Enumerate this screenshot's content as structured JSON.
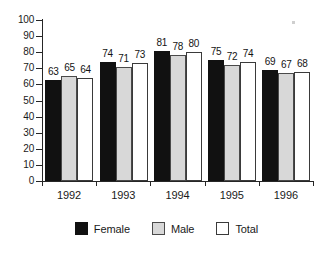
{
  "chart_data": {
    "type": "bar",
    "title": "",
    "subtitle": "",
    "xlabel": "",
    "ylabel": "",
    "categories": [
      "1992",
      "1993",
      "1994",
      "1995",
      "1996"
    ],
    "series": [
      {
        "name": "Female",
        "color": "#111111",
        "values": [
          63,
          74,
          81,
          75,
          69
        ]
      },
      {
        "name": "Male",
        "color": "#d8d8d8",
        "values": [
          65,
          71,
          78,
          72,
          67
        ]
      },
      {
        "name": "Total",
        "color": "#ffffff",
        "values": [
          64,
          73,
          80,
          74,
          68
        ]
      }
    ],
    "ylim": [
      0,
      100
    ],
    "ytick_step": 10,
    "yticks": [
      "0",
      "10",
      "20",
      "30",
      "40",
      "50",
      "60",
      "70",
      "80",
      "90",
      "100"
    ],
    "grid": false,
    "data_labels": true,
    "legend_position": "bottom",
    "legend": [
      {
        "label": "Female",
        "swatch": "female"
      },
      {
        "label": "Male",
        "swatch": "male"
      },
      {
        "label": "Total",
        "swatch": "total"
      }
    ]
  }
}
